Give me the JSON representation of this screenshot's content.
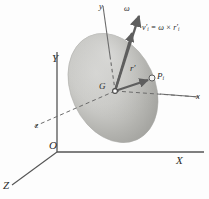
{
  "figure": {
    "background_color": "#fdfdfd",
    "body_color_light": "#d8d8d6",
    "body_color_mid": "#b9b9b6",
    "body_color_dark": "#9a9a97",
    "line_color": "#4a4a4a",
    "arrow_color": "#6a6a6a",
    "text_color": "#2a2a2a"
  },
  "labels": {
    "global_x": "X",
    "global_y": "Y",
    "global_z": "Z",
    "origin": "O",
    "body_x": "x",
    "body_y": "y",
    "body_z": "z",
    "mass_center": "G",
    "particle": "P",
    "particle_sub": "i",
    "radius_vector": "r",
    "radius_prime": "′",
    "omega": "ω",
    "velocity": "v",
    "velocity_prime": "′",
    "velocity_sub": "i",
    "equation_rhs_omega": "ω",
    "equation_cross": "×",
    "equation_r": "r",
    "equation_r_prime": "′",
    "equation_r_sub": "i",
    "equation_equals": "="
  },
  "geometry": {
    "origin_point": [
      57,
      152
    ],
    "global_x_end": [
      205,
      152
    ],
    "global_y_end": [
      57,
      52
    ],
    "global_z_end": [
      9,
      187
    ],
    "mass_center_point": [
      115,
      91
    ],
    "particle_point": [
      152,
      78
    ],
    "body_y_top": [
      103,
      6
    ],
    "body_x_end": [
      200,
      97
    ],
    "body_z_end": [
      30,
      128
    ],
    "omega_tip": [
      140,
      13
    ],
    "velocity_tip": [
      133,
      30
    ],
    "ellipse_center": [
      113,
      88
    ],
    "ellipse_rx": 42,
    "ellipse_ry": 57,
    "ellipse_rotation_deg": -25
  },
  "annotations": {
    "vector_equation": "v′ᵢ = ω × r′ᵢ",
    "description": "Velocity of particle P_i relative to mass center G equals angular velocity omega crossed with position vector r prime i"
  }
}
